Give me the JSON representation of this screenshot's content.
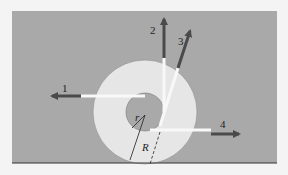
{
  "figure": {
    "colors": {
      "background": "#a9a9a9",
      "page": "#f4f4f4",
      "outer_disk": "#e6e6e6",
      "inner_disk": "#a9a9a9",
      "arrow": "#4a4a4a",
      "ground": "#333333"
    },
    "forces": [
      {
        "label": "1"
      },
      {
        "label": "2"
      },
      {
        "label": "3"
      },
      {
        "label": "4"
      }
    ],
    "radii": {
      "inner_label": "r",
      "outer_label": "R"
    }
  }
}
